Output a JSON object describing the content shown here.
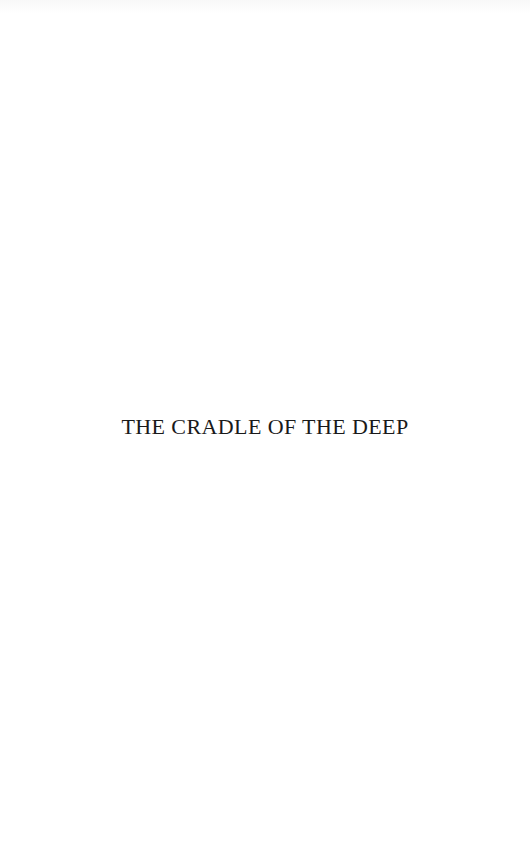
{
  "page": {
    "type": "half-title",
    "title": "THE CRADLE OF THE DEEP"
  },
  "colors": {
    "background": "#ffffff",
    "text": "#1a1a1a"
  }
}
